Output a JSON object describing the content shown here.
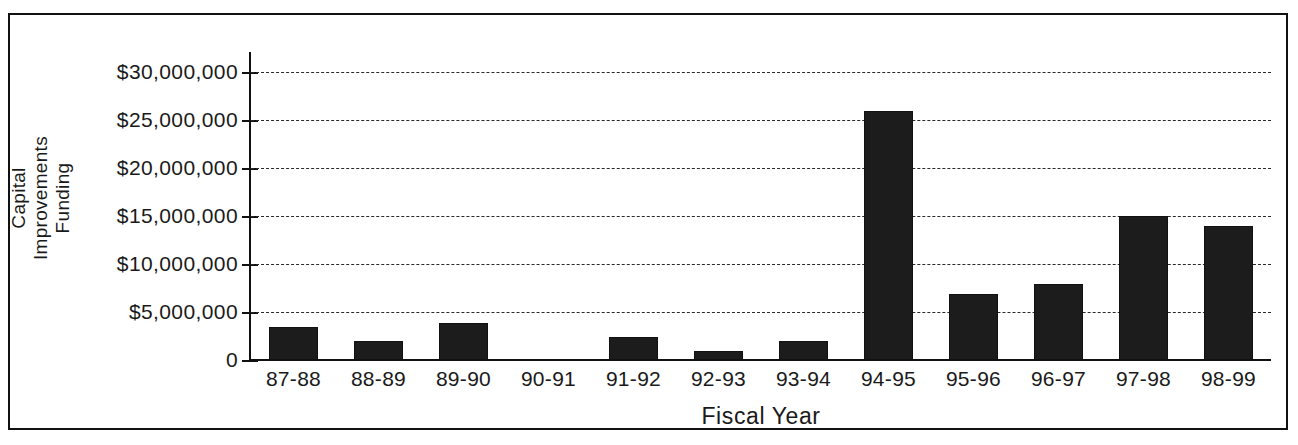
{
  "chart_data": {
    "type": "bar",
    "title": "",
    "xlabel": "Fiscal Year",
    "ylabel": "Capital Improvements Funding",
    "ylabel_lines": [
      "Capital Improvements",
      "Funding"
    ],
    "categories": [
      "87-88",
      "88-89",
      "89-90",
      "90-91",
      "91-92",
      "92-93",
      "93-94",
      "94-95",
      "95-96",
      "96-97",
      "97-98",
      "98-99"
    ],
    "values": [
      3400000,
      2000000,
      3900000,
      0,
      2400000,
      900000,
      2000000,
      25900000,
      6900000,
      7900000,
      15000000,
      14000000
    ],
    "ylim": [
      0,
      30000000
    ],
    "ytick_values": [
      30000000,
      25000000,
      20000000,
      15000000,
      10000000,
      5000000,
      0
    ],
    "ytick_labels": [
      "$30,000,000",
      "$25,000,000",
      "$20,000,000",
      "$15,000,000",
      "$10,000,000",
      "$5,000,000",
      "0"
    ],
    "grid": true,
    "grid_style": "dashed",
    "legend": false,
    "bar_color": "#1c1c1c",
    "axis_color": "#111111",
    "background": "#ffffff",
    "frame": true
  }
}
